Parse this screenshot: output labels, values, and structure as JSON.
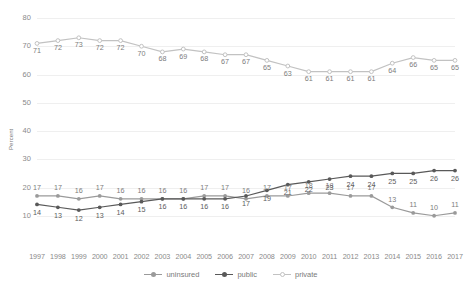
{
  "chart_data": {
    "type": "line",
    "title": "",
    "xlabel": "",
    "ylabel": "Percent",
    "ylim": [
      0,
      80
    ],
    "yticks": [
      10,
      20,
      30,
      40,
      50,
      60,
      70,
      80
    ],
    "grid": true,
    "legend_position": "bottom",
    "categories": [
      1997,
      1998,
      1999,
      2000,
      2001,
      2002,
      2003,
      2004,
      2005,
      2006,
      2007,
      2008,
      2009,
      2010,
      2011,
      2012,
      2013,
      2014,
      2015,
      2016,
      2017
    ],
    "xticks": [
      "1997",
      "1998",
      "1999",
      "2000",
      "2001",
      "2002",
      "2003",
      "2004",
      "2005",
      "2006",
      "2007",
      "2008",
      "2009",
      "2010",
      "2011",
      "2012",
      "2013",
      "2014",
      "2015",
      "2016",
      "2017"
    ],
    "series": [
      {
        "name": "uninsured",
        "color": "#9a9a9a",
        "marker": "filled-circle",
        "values": [
          17,
          17,
          16,
          17,
          16,
          16,
          16,
          16,
          17,
          17,
          16,
          17,
          17,
          18,
          18,
          17,
          17,
          13,
          11,
          10,
          11
        ]
      },
      {
        "name": "public",
        "color": "#595959",
        "marker": "filled-circle",
        "values": [
          14,
          13,
          12,
          13,
          14,
          15,
          16,
          16,
          16,
          16,
          17,
          19,
          21,
          22,
          23,
          24,
          24,
          25,
          25,
          26,
          26
        ]
      },
      {
        "name": "private",
        "color": "#c2c2c2",
        "marker": "open-circle",
        "values": [
          71,
          72,
          73,
          72,
          72,
          70,
          68,
          69,
          68,
          67,
          67,
          65,
          63,
          61,
          61,
          61,
          61,
          64,
          66,
          65,
          65
        ]
      }
    ]
  },
  "legend": {
    "items": [
      {
        "label": "uninsured"
      },
      {
        "label": "public"
      },
      {
        "label": "private"
      }
    ]
  },
  "colors": {
    "uninsured": "#9a9a9a",
    "public": "#595959",
    "private": "#c2c2c2",
    "grid": "#efefef",
    "tick_text": "#8a8a8a"
  }
}
